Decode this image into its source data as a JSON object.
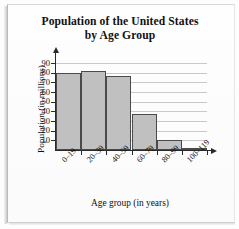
{
  "chart_data": {
    "type": "bar",
    "title": "Population of the United States by Age Group",
    "title_line1": "Population of the United States",
    "title_line2": "by Age Group",
    "xlabel": "Age group (in years)",
    "ylabel": "Population (in millions)",
    "categories": [
      "0–19",
      "20–39",
      "40–59",
      "60–79",
      "80–99",
      "100–119"
    ],
    "values": [
      80,
      82,
      76,
      37,
      10,
      1
    ],
    "ylim": [
      0,
      95
    ],
    "yticks": [
      10,
      20,
      30,
      40,
      50,
      60,
      70,
      80,
      90
    ],
    "ytick_labels": [
      "10",
      "20",
      "30",
      "40",
      "50",
      "60",
      "70",
      "80",
      "90"
    ],
    "grid": true,
    "legend": "none",
    "bar_color": "#c0c0c0",
    "bar_edge_color": "#4a4a4a",
    "axis_color": "#2a2a2a",
    "grid_color": "#c9c9c9"
  }
}
